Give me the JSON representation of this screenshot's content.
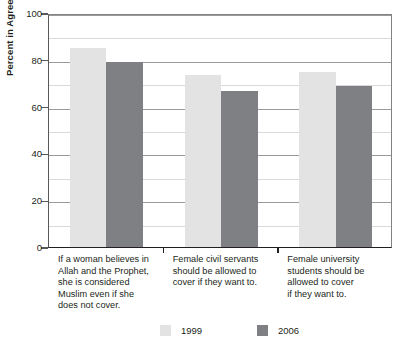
{
  "chart_data": {
    "type": "bar",
    "title": "",
    "subtitle": "",
    "xlabel": "",
    "ylabel": "Percent in Agreement",
    "ylim": [
      0,
      100
    ],
    "yticks": [
      0,
      20,
      40,
      60,
      80,
      100
    ],
    "ytick_labels": [
      "0",
      "20",
      "40",
      "60",
      "80",
      "100"
    ],
    "grid": true,
    "legend_position": "bottom",
    "categories": [
      "If a woman believes in Allah and the Prophet, she is considered Muslim even if she does not cover.",
      "Female civil servants should be allowed to cover if they want to.",
      "Female university students should be allowed to cover if they want to."
    ],
    "category_lines": [
      [
        "If a woman believes in",
        "Allah and the Prophet,",
        "she is considered",
        "Muslim even if she",
        "does not cover."
      ],
      [
        "Female civil servants",
        "should be allowed to",
        "cover if they want to."
      ],
      [
        "Female university",
        "students should be",
        "allowed to cover",
        "if they want to."
      ]
    ],
    "series": [
      {
        "name": "1999",
        "color": "#e3e3e3",
        "values": [
          85,
          73.5,
          75
        ]
      },
      {
        "name": "2006",
        "color": "#7f8084",
        "values": [
          79,
          66.5,
          69
        ]
      }
    ]
  },
  "legend": {
    "items": [
      {
        "label": "1999",
        "color": "#e3e3e3"
      },
      {
        "label": "2006",
        "color": "#7f8084"
      }
    ]
  },
  "axis": {
    "y_title": "Percent in Agreement"
  },
  "colors": {
    "series_1999": "#e3e3e3",
    "series_2006": "#7f8084",
    "axis": "#231f20",
    "grid": "#d9d9d9",
    "text": "#231f20",
    "background": "#ffffff"
  }
}
